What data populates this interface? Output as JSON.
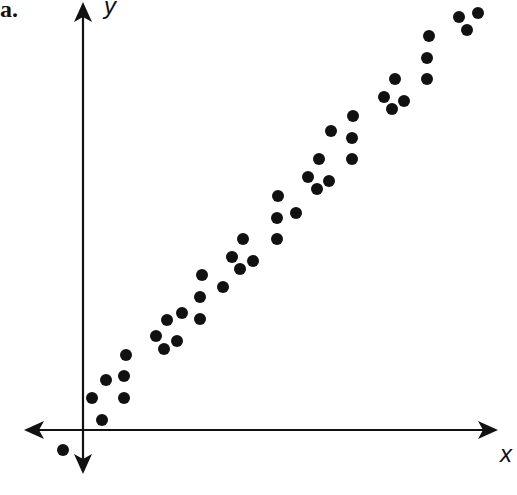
{
  "panel_label": "a.",
  "chart_data": {
    "type": "scatter",
    "title": "",
    "xlabel": "x",
    "ylabel": "y",
    "grid": false,
    "legend": null,
    "ticks": false,
    "origin_px": [
      83,
      430
    ],
    "points_px": [
      [
        63,
        450
      ],
      [
        102,
        420
      ],
      [
        92,
        398
      ],
      [
        106,
        380
      ],
      [
        124,
        398
      ],
      [
        124,
        376
      ],
      [
        126,
        355
      ],
      [
        156,
        336
      ],
      [
        164,
        349
      ],
      [
        177,
        341
      ],
      [
        167,
        320
      ],
      [
        182,
        313
      ],
      [
        200,
        319
      ],
      [
        200,
        297
      ],
      [
        202,
        275
      ],
      [
        223,
        287
      ],
      [
        232,
        257
      ],
      [
        240,
        269
      ],
      [
        243,
        239
      ],
      [
        253,
        261
      ],
      [
        277,
        239
      ],
      [
        277,
        218
      ],
      [
        278,
        196
      ],
      [
        296,
        213
      ],
      [
        308,
        177
      ],
      [
        317,
        189
      ],
      [
        329,
        181
      ],
      [
        319,
        159
      ],
      [
        331,
        131
      ],
      [
        352,
        159
      ],
      [
        352,
        138
      ],
      [
        353,
        116
      ],
      [
        384,
        97
      ],
      [
        392,
        109
      ],
      [
        404,
        101
      ],
      [
        395,
        79
      ],
      [
        427,
        79
      ],
      [
        427,
        58
      ],
      [
        429,
        36
      ],
      [
        459,
        17
      ],
      [
        467,
        30
      ],
      [
        478,
        13
      ]
    ],
    "points": [
      [
        -20,
        -20
      ],
      [
        19,
        10
      ],
      [
        9,
        32
      ],
      [
        23,
        50
      ],
      [
        41,
        32
      ],
      [
        41,
        54
      ],
      [
        43,
        75
      ],
      [
        73,
        94
      ],
      [
        81,
        81
      ],
      [
        94,
        89
      ],
      [
        84,
        110
      ],
      [
        99,
        117
      ],
      [
        117,
        111
      ],
      [
        117,
        133
      ],
      [
        119,
        155
      ],
      [
        140,
        143
      ],
      [
        149,
        173
      ],
      [
        157,
        161
      ],
      [
        160,
        191
      ],
      [
        170,
        169
      ],
      [
        194,
        191
      ],
      [
        194,
        212
      ],
      [
        195,
        234
      ],
      [
        213,
        217
      ],
      [
        225,
        253
      ],
      [
        234,
        241
      ],
      [
        246,
        249
      ],
      [
        236,
        271
      ],
      [
        248,
        299
      ],
      [
        269,
        271
      ],
      [
        269,
        292
      ],
      [
        270,
        314
      ],
      [
        301,
        333
      ],
      [
        309,
        321
      ],
      [
        321,
        329
      ],
      [
        312,
        351
      ],
      [
        344,
        351
      ],
      [
        344,
        372
      ],
      [
        346,
        394
      ],
      [
        376,
        413
      ],
      [
        384,
        400
      ],
      [
        395,
        417
      ]
    ]
  }
}
